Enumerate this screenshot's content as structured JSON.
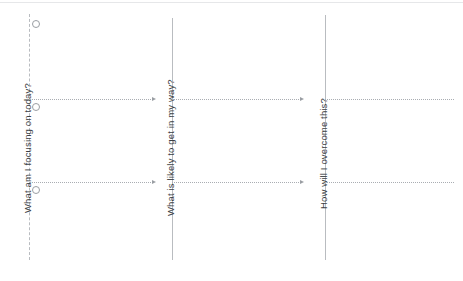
{
  "worksheet": {
    "background_color": "#ffffff",
    "line_color": "#b9bcc0",
    "text_color": "#3c3f44",
    "columns": [
      {
        "id": "focus",
        "label": "What am I focusing on today?",
        "bullets": [
          "bullet-1",
          "bullet-2",
          "bullet-3"
        ]
      },
      {
        "id": "obstacles",
        "label": "What is likely to get in my way?",
        "bullets": []
      },
      {
        "id": "overcome",
        "label": "How will I overcome this?",
        "bullets": []
      }
    ],
    "rows": [
      {
        "id": "row-1"
      },
      {
        "id": "row-2"
      }
    ]
  }
}
